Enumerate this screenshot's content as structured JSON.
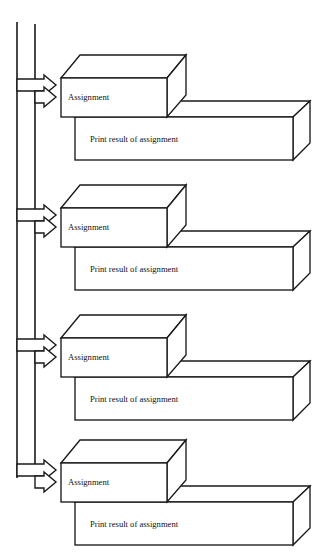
{
  "diagram": {
    "style": "3d-isometric-block-flowchart",
    "colors": {
      "stroke": "#1a1a1a",
      "face": "#ffffff",
      "background": "#ffffff",
      "text": "#111111"
    },
    "rails": [
      {
        "name": "outer-rail",
        "x": 17,
        "y_top": 22,
        "y_bottom": 478
      },
      {
        "name": "inner-rail",
        "x": 35,
        "y_top": 24,
        "y_bottom": 466
      }
    ],
    "groups": [
      {
        "index": 1,
        "assignment_label": "Assignment",
        "print_label": "Print result of assignment",
        "arrows": [
          {
            "name": "outer-arrow-1",
            "from_rail": "outer-rail",
            "target": "assignment-box-1",
            "tip_y": 85
          },
          {
            "name": "inner-arrow-1",
            "from_rail": "inner-rail",
            "target": "assignment-box-1",
            "tip_y": 97
          }
        ]
      },
      {
        "index": 2,
        "assignment_label": "Assignment",
        "print_label": "Print result of assignment",
        "arrows": [
          {
            "name": "outer-arrow-2",
            "from_rail": "outer-rail",
            "target": "assignment-box-2",
            "tip_y": 215
          },
          {
            "name": "inner-arrow-2",
            "from_rail": "inner-rail",
            "target": "assignment-box-2",
            "tip_y": 227
          }
        ]
      },
      {
        "index": 3,
        "assignment_label": "Assignment",
        "print_label": "Print result of assignment",
        "arrows": [
          {
            "name": "outer-arrow-3",
            "from_rail": "outer-rail",
            "target": "assignment-box-3",
            "tip_y": 345
          },
          {
            "name": "inner-arrow-3",
            "from_rail": "inner-rail",
            "target": "assignment-box-3",
            "tip_y": 357
          }
        ]
      },
      {
        "index": 4,
        "assignment_label": "Assignment",
        "print_label": "Print result of assignment",
        "arrows": [
          {
            "name": "outer-arrow-4",
            "from_rail": "outer-rail",
            "target": "assignment-box-4",
            "tip_y": 470
          },
          {
            "name": "inner-arrow-4",
            "from_rail": "inner-rail",
            "target": "assignment-box-4",
            "tip_y": 482
          }
        ]
      }
    ]
  }
}
